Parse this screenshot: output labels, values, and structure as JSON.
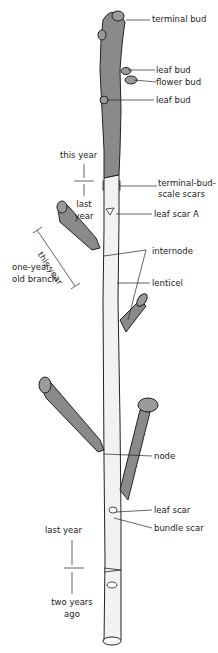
{
  "diagram": {
    "type": "twig anatomy illustration",
    "labels": {
      "terminal_bud": "terminal bud",
      "leaf_bud_1": "leaf bud",
      "flower_bud": "flower bud",
      "leaf_bud_2": "leaf bud",
      "this_year_main": "this year",
      "last_year_main_1": "last",
      "last_year_main_2": "year",
      "terminal_bud_scale_scars_1": "terminal-bud-",
      "terminal_bud_scale_scars_2": "scale scars",
      "leaf_scar_a": "leaf scar A",
      "this_year_branch": "this year",
      "internode": "internode",
      "one_year_old_branch_1": "one-year-",
      "one_year_old_branch_2": "old branch",
      "lenticel": "lenticel",
      "node": "node",
      "leaf_scar": "leaf scar",
      "bundle_scar": "bundle scar",
      "last_year_lower": "last year",
      "two_years_ago_1": "two years",
      "two_years_ago_2": "ago"
    },
    "colors": {
      "dark_bark": "#8a8a8a",
      "light_bark": "#f2f2f2",
      "outline": "#222222"
    }
  }
}
